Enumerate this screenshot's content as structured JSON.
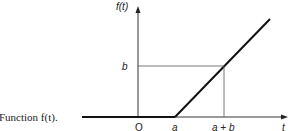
{
  "caption": "Function f(t).",
  "axes": {
    "y_label": "f(t)",
    "x_label": "t",
    "origin_label": "O"
  },
  "ticks": {
    "x": [
      "a",
      "a + b"
    ],
    "y": [
      "b"
    ]
  },
  "function": {
    "description": "f(t) = 0 for t < a; f(t) = t - a for t >= a",
    "segments": [
      {
        "from": "t < a",
        "value": "0"
      },
      {
        "from": "t >= a",
        "value": "t - a (slope 1)"
      }
    ],
    "marked_point": {
      "t": "a + b",
      "f": "b"
    }
  },
  "colors": {
    "line": "#222222",
    "guide": "#555555"
  }
}
